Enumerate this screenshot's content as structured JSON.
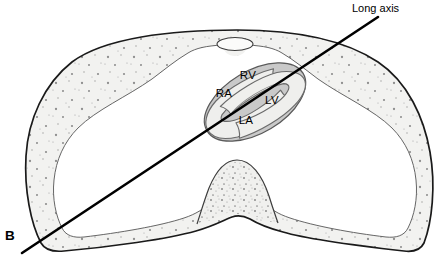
{
  "figure": {
    "panel_letter": "B",
    "axis_line_label": "Long axis",
    "chambers": [
      {
        "id": "rv",
        "label": "RV",
        "name": "right-ventricle",
        "x": 248,
        "y": 79
      },
      {
        "id": "ra",
        "label": "RA",
        "name": "right-atrium",
        "x": 224,
        "y": 97
      },
      {
        "id": "lv",
        "label": "LV",
        "name": "left-ventricle",
        "x": 272,
        "y": 104
      },
      {
        "id": "la",
        "label": "LA",
        "name": "left-atrium",
        "x": 246,
        "y": 124
      }
    ],
    "axis_line": {
      "x1": 22,
      "y1": 253,
      "x2": 378,
      "y2": 17
    },
    "axis_label_position": {
      "x": 352,
      "y": 12
    },
    "panel_label_position": {
      "x": 5,
      "y": 240
    },
    "colors": {
      "outline": "#1a1a1a",
      "body_fill": "#f2f2f0",
      "stipple": "#8f8f8f",
      "myocardium": "#c9c9c9",
      "chamber_fill": "#efefed",
      "axis_line": "#000000",
      "background": "#ffffff"
    },
    "anatomy_notes": {
      "body_wall": "thoracic-wall-cross-section",
      "sternum": "sternum-ellipse",
      "vertebra": "vertebral-body",
      "heart": "heart-oblique-section"
    }
  }
}
